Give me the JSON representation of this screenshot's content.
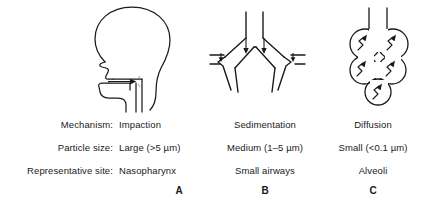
{
  "figure": {
    "ink_color": "#1a1a1a",
    "background_color": "#ffffff"
  },
  "row_labels": {
    "mechanism": "Mechanism:",
    "particle_size": "Particle size:",
    "representative_site": "Representative site:"
  },
  "panels": [
    {
      "letter": "A",
      "mechanism": "Impaction",
      "particle_size": "Large (>5 µm)",
      "representative_site": "Nasopharynx",
      "illustration": "head-profile-upper-airway"
    },
    {
      "letter": "B",
      "mechanism": "Sedimentation",
      "particle_size": "Medium (1–5 µm)",
      "representative_site": "Small airways",
      "illustration": "airway-bifurcation"
    },
    {
      "letter": "C",
      "mechanism": "Diffusion",
      "particle_size": "Small (<0.1 µm)",
      "representative_site": "Alveoli",
      "illustration": "alveolar-sac-cluster"
    }
  ]
}
